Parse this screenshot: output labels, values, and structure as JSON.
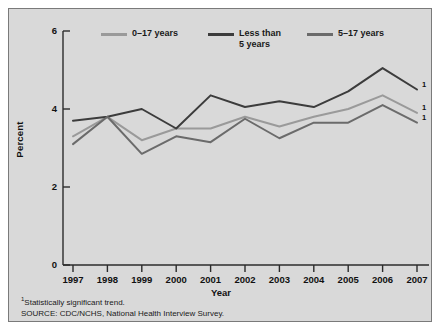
{
  "figure": {
    "background_color": "#d9d9d9",
    "border_color": "#7a7a7a"
  },
  "footnotes": {
    "marker": "1",
    "note": "Statistically significant trend.",
    "source": "SOURCE: CDC/NCHS, National Health Interview Survey."
  },
  "endnote_markers": [
    "1",
    "1",
    "1"
  ],
  "chart_data": {
    "type": "line",
    "title": "",
    "xlabel": "Year",
    "ylabel": "Percent",
    "categories": [
      "1997",
      "1998",
      "1999",
      "2000",
      "2001",
      "2002",
      "2003",
      "2004",
      "2005",
      "2006",
      "2007"
    ],
    "x": [
      1997,
      1998,
      1999,
      2000,
      2001,
      2002,
      2003,
      2004,
      2005,
      2006,
      2007
    ],
    "xlim": [
      1997,
      2007
    ],
    "ylim": [
      0,
      6
    ],
    "yticks": [
      0,
      2,
      4,
      6
    ],
    "ytick_labels": [
      "0",
      "2",
      "4",
      "6"
    ],
    "grid": false,
    "legend_position": "top",
    "series": [
      {
        "name": "0–17 years",
        "color": "#9a9a9a",
        "values": [
          3.3,
          3.8,
          3.2,
          3.5,
          3.5,
          3.8,
          3.55,
          3.8,
          4.0,
          4.35,
          3.9
        ]
      },
      {
        "name": "Less than\n5 years",
        "color": "#3c3c3c",
        "values": [
          3.7,
          3.8,
          4.0,
          3.5,
          4.35,
          4.05,
          4.2,
          4.05,
          4.45,
          5.05,
          4.5
        ]
      },
      {
        "name": "5–17 years",
        "color": "#6b6b6b",
        "values": [
          3.1,
          3.8,
          2.85,
          3.3,
          3.15,
          3.75,
          3.25,
          3.65,
          3.65,
          4.1,
          3.65
        ]
      }
    ]
  }
}
